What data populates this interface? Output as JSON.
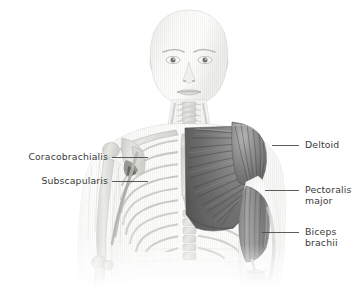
{
  "figure": {
    "view": "anterior",
    "background_color": "#ffffff",
    "width": 359,
    "height": 288,
    "style": "grayscale medical illustration",
    "text_color": "#3a3a3a",
    "leader_line_color": "#4a4a4a",
    "muscle_dark_color": "#6e6e6e",
    "muscle_mid_color": "#9a9a9a",
    "bone_color": "#d8d8d6",
    "skin_color": "#eeeeec"
  },
  "labels": {
    "left": [
      {
        "id": "coracobrachialis",
        "text": "Coracobrachialis",
        "text_x": 4,
        "text_y": 151,
        "text_width": 104,
        "leader_x1": 112,
        "leader_x2": 148,
        "leader_y": 157
      },
      {
        "id": "subscapularis",
        "text": "Subscapularis",
        "text_x": 4,
        "text_y": 175,
        "text_width": 104,
        "leader_x1": 112,
        "leader_x2": 148,
        "leader_y": 181
      }
    ],
    "right": [
      {
        "id": "deltoid",
        "text": "Deltoid",
        "text_x": 305,
        "text_y": 139,
        "leader_x1": 272,
        "leader_x2": 299,
        "leader_y": 145
      },
      {
        "id": "pectoralis-major",
        "text": "Pectoralis\nmajor",
        "text_x": 305,
        "text_y": 184,
        "leader_x1": 265,
        "leader_x2": 299,
        "leader_y": 190
      },
      {
        "id": "biceps-brachii",
        "text": "Biceps\nbrachii",
        "text_x": 305,
        "text_y": 226,
        "leader_x1": 262,
        "leader_x2": 299,
        "leader_y": 232
      }
    ]
  },
  "structures": {
    "head": "bald human head, anterior view",
    "neck": "neck with cervical vertebrae",
    "left_side": "skeletal ribcage, clavicle, scapula, sternum, humerus",
    "right_side": "pectoralis major, deltoid, biceps brachii musculature",
    "fade": "illustration fades to white at lower edge"
  }
}
